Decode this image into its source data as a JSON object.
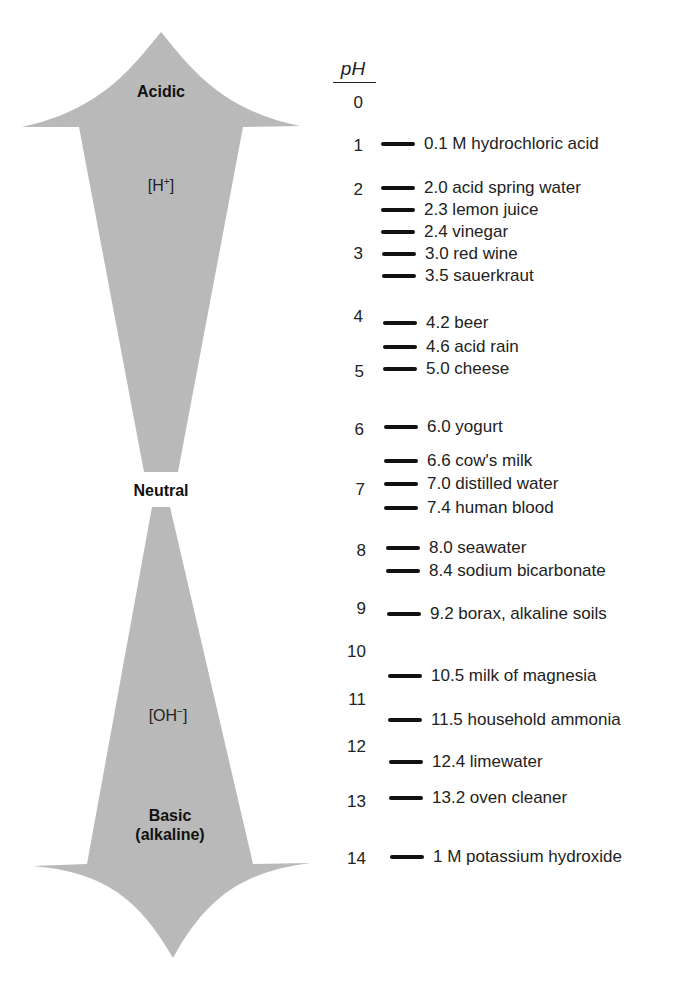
{
  "diagram": {
    "axis_label": "pH",
    "arrow_up": {
      "label": "Acidic",
      "ion": "[H",
      "ion_charge": "+",
      "ion_close": "]"
    },
    "neutral_label": "Neutral",
    "arrow_down": {
      "label_line1": "Basic",
      "label_line2": "(alkaline)",
      "ion": "[OH",
      "ion_charge": "−",
      "ion_close": "]"
    },
    "colors": {
      "arrow_fill": "#b9b9b9",
      "text": "#1a1a1a",
      "dash": "#111111"
    },
    "scale_ticks": [
      "0",
      "1",
      "2",
      "3",
      "4",
      "5",
      "6",
      "7",
      "8",
      "9",
      "10",
      "11",
      "12",
      "13",
      "14"
    ],
    "items": [
      {
        "ph": 0.1,
        "label": "0.1 M hydrochloric acid"
      },
      {
        "ph": 2.0,
        "label": "2.0 acid spring water"
      },
      {
        "ph": 2.3,
        "label": "2.3 lemon juice"
      },
      {
        "ph": 2.4,
        "label": "2.4 vinegar"
      },
      {
        "ph": 3.0,
        "label": "3.0 red wine"
      },
      {
        "ph": 3.5,
        "label": "3.5 sauerkraut"
      },
      {
        "ph": 4.2,
        "label": "4.2 beer"
      },
      {
        "ph": 4.6,
        "label": "4.6 acid rain"
      },
      {
        "ph": 5.0,
        "label": "5.0 cheese"
      },
      {
        "ph": 6.0,
        "label": "6.0 yogurt"
      },
      {
        "ph": 6.6,
        "label": "6.6 cow's milk"
      },
      {
        "ph": 7.0,
        "label": "7.0 distilled water"
      },
      {
        "ph": 7.4,
        "label": "7.4 human blood"
      },
      {
        "ph": 8.0,
        "label": "8.0 seawater"
      },
      {
        "ph": 8.4,
        "label": "8.4 sodium bicarbonate"
      },
      {
        "ph": 9.2,
        "label": "9.2 borax, alkaline soils"
      },
      {
        "ph": 10.5,
        "label": "10.5 milk of magnesia"
      },
      {
        "ph": 11.5,
        "label": "11.5 household ammonia"
      },
      {
        "ph": 12.4,
        "label": "12.4 limewater"
      },
      {
        "ph": 13.2,
        "label": "13.2 oven cleaner"
      },
      {
        "ph": 14,
        "label": "1 M potassium hydroxide"
      }
    ]
  }
}
